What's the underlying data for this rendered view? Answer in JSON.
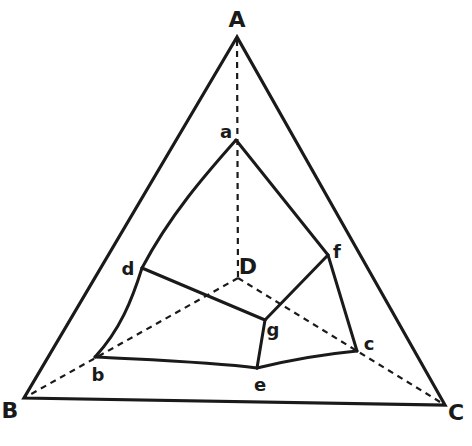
{
  "diagram": {
    "type": "tetrahedral projection diagram",
    "outer_vertices": {
      "A": {
        "label": "A",
        "x": 237,
        "y": 37,
        "label_x": 237,
        "label_y": 27
      },
      "B": {
        "label": "B",
        "x": 24,
        "y": 398,
        "label_x": 10,
        "label_y": 418
      },
      "C": {
        "label": "C",
        "x": 445,
        "y": 405,
        "label_x": 456,
        "label_y": 420
      },
      "D": {
        "label": "D",
        "x": 238,
        "y": 278,
        "label_x": 248,
        "label_y": 274
      }
    },
    "inner_vertices": {
      "a": {
        "label": "a",
        "x": 236,
        "y": 140,
        "label_x": 226,
        "label_y": 138
      },
      "b": {
        "label": "b",
        "x": 95,
        "y": 357,
        "label_x": 98,
        "label_y": 381
      },
      "c": {
        "label": "c",
        "x": 357,
        "y": 351,
        "label_x": 369,
        "label_y": 350
      },
      "d": {
        "label": "d",
        "x": 142,
        "y": 268,
        "label_x": 128,
        "label_y": 275
      },
      "e": {
        "label": "e",
        "x": 257,
        "y": 368,
        "label_x": 260,
        "label_y": 391
      },
      "f": {
        "label": "f",
        "x": 328,
        "y": 255,
        "label_x": 337,
        "label_y": 258
      },
      "g": {
        "label": "g",
        "x": 265,
        "y": 320,
        "label_x": 273,
        "label_y": 336
      }
    },
    "solid_edges": [
      [
        "A",
        "B"
      ],
      [
        "A",
        "C"
      ],
      [
        "B",
        "C"
      ],
      [
        "a",
        "d"
      ],
      [
        "a",
        "f"
      ],
      [
        "d",
        "b"
      ],
      [
        "d",
        "g"
      ],
      [
        "f",
        "g"
      ],
      [
        "f",
        "c"
      ],
      [
        "b",
        "e"
      ],
      [
        "e",
        "c"
      ],
      [
        "g",
        "e"
      ]
    ],
    "dashed_edges": [
      [
        "A",
        "D"
      ],
      [
        "D",
        "B"
      ],
      [
        "D",
        "C"
      ]
    ]
  }
}
